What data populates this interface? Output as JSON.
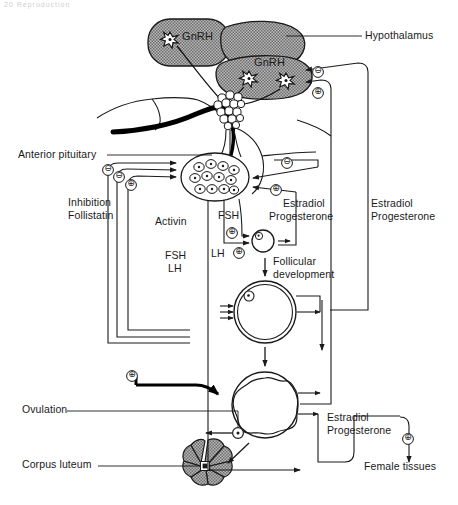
{
  "figure": {
    "type": "diagram",
    "page_header": "20   Reproduction"
  },
  "labels": {
    "hypothalamus": "Hypothalamus",
    "gnrh_upper": "GnRH",
    "gnrh_lower": "GnRH",
    "anterior_pituitary": "Anterior pituitary",
    "inhibition": "Inhibition",
    "follistatin": "Follistatin",
    "activin": "Activin",
    "fsh_lh_left_1": "FSH",
    "fsh_lh_left_2": "LH",
    "fsh_mid": "FSH",
    "lh_mid": "LH",
    "estradiol_mid": "Estradiol",
    "progesterone_mid": "Progesterone",
    "estradiol_right": "Estradiol",
    "progesterone_right": "Progesterone",
    "follicular": "Follicular",
    "development": "development",
    "ovulation": "Ovulation",
    "corpus_luteum": "Corpus luteum",
    "estradiol_bottom": "Estradiol",
    "progesterone_bottom": "Progesterone",
    "female_tissues": "Female tissues"
  },
  "signs": {
    "neg_hypothalamus": "⊖",
    "pos_hypothalamus": "⊕",
    "neg_pituitary_1": "⊖",
    "neg_pituitary_2": "⊖",
    "pos_pituitary": "⊕",
    "neg_pit_right": "⊖",
    "pos_pit_right": "⊕",
    "pos_fsh": "⊕",
    "pos_lh": "⊕",
    "pos_ovary": "⊕",
    "pos_female_tissues": "⊕"
  },
  "colors": {
    "line": "#1a1a1a",
    "gray_fill": "#9b9b9b",
    "text": "#1a1a1a",
    "background": "#ffffff"
  }
}
